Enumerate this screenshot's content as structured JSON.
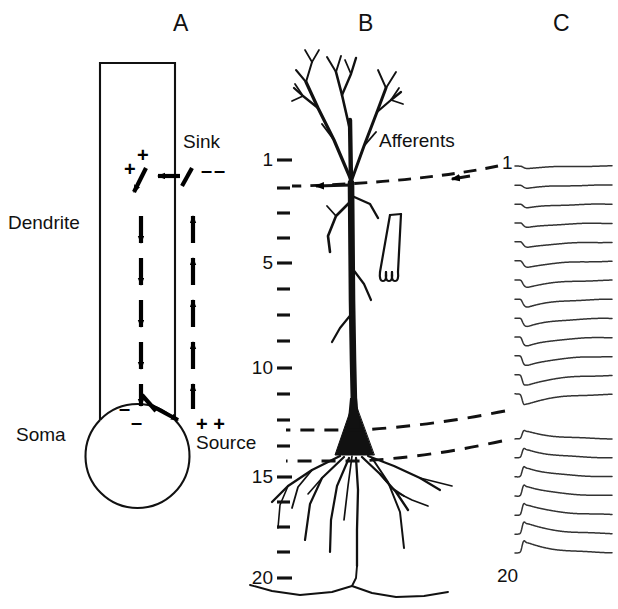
{
  "figure": {
    "background": "#ffffff",
    "ink": "#111111",
    "width": 618,
    "height": 609
  },
  "panels": [
    {
      "id": "A",
      "letter": "A",
      "x": 173,
      "y": 10
    },
    {
      "id": "B",
      "letter": "B",
      "x": 358,
      "y": 10
    },
    {
      "id": "C",
      "letter": "C",
      "x": 553,
      "y": 10
    }
  ],
  "panel_a": {
    "labels": {
      "dendrite": "Dendrite",
      "soma": "Soma",
      "sink": "Sink",
      "source": "Source"
    },
    "charges": {
      "sink_inside": "+",
      "sink_inside_2": "+",
      "sink_outside": "––",
      "source_inside": "–",
      "source_inside_2": "–",
      "source_outside": "+ +"
    },
    "geometry": {
      "dendrite_left": 100,
      "dendrite_right": 175,
      "dendrite_top": 63,
      "soma_cx": 137,
      "soma_cy": 455,
      "soma_r": 52
    },
    "arrow_counts": {
      "inside_downward": 5,
      "outside_upward": 5
    }
  },
  "panel_b": {
    "labels": {
      "afferents": "Afferents"
    },
    "depth_scale": {
      "unit_ticks": 20,
      "labeled": [
        {
          "value": "1",
          "y": 160
        },
        {
          "value": "5",
          "y": 263
        },
        {
          "value": "10",
          "y": 368
        },
        {
          "value": "15",
          "y": 477
        },
        {
          "value": "20",
          "y": 578
        }
      ],
      "minor_y": [
        188,
        213,
        238,
        289,
        315,
        341,
        394,
        420,
        446,
        502,
        527,
        552
      ],
      "tick_x_start": 277,
      "tick_x_end": 292
    },
    "dashed_lines": [
      {
        "name": "afferent-band",
        "y": 183,
        "arrowheads": 2
      },
      {
        "name": "soma-upper-band",
        "y": 428,
        "arrowheads": 0
      },
      {
        "name": "soma-lower-band",
        "y": 458,
        "arrowheads": 0
      }
    ],
    "electrode": {
      "name": "recording-pipette",
      "x": 400,
      "y": 218
    }
  },
  "chart_data": {
    "type": "line",
    "title": "C",
    "xlabel": "",
    "ylabel": "Depth (tick units)",
    "legend": "none",
    "grid": false,
    "depth_labels": {
      "first": "1",
      "last": "20"
    },
    "x_range_ms": [
      0,
      30
    ],
    "traces": [
      {
        "depth": 1,
        "polarity": "negative",
        "amplitude": 0.22,
        "spike": 0.0
      },
      {
        "depth": 2,
        "polarity": "negative",
        "amplitude": 0.3,
        "spike": 0.0
      },
      {
        "depth": 3,
        "polarity": "negative",
        "amplitude": 0.38,
        "spike": 0.0
      },
      {
        "depth": 4,
        "polarity": "negative",
        "amplitude": 0.46,
        "spike": 0.0
      },
      {
        "depth": 5,
        "polarity": "negative",
        "amplitude": 0.54,
        "spike": 0.0
      },
      {
        "depth": 6,
        "polarity": "negative",
        "amplitude": 0.62,
        "spike": 0.02
      },
      {
        "depth": 7,
        "polarity": "negative",
        "amplitude": 0.7,
        "spike": 0.05
      },
      {
        "depth": 8,
        "polarity": "negative",
        "amplitude": 0.78,
        "spike": 0.08
      },
      {
        "depth": 9,
        "polarity": "negative",
        "amplitude": 0.84,
        "spike": 0.12
      },
      {
        "depth": 10,
        "polarity": "negative",
        "amplitude": 0.9,
        "spike": 0.18
      },
      {
        "depth": 11,
        "polarity": "negative",
        "amplitude": 0.95,
        "spike": 0.26
      },
      {
        "depth": 12,
        "polarity": "negative",
        "amplitude": 1.0,
        "spike": 0.36
      },
      {
        "depth": 13,
        "polarity": "negative",
        "amplitude": 0.96,
        "spike": 0.46
      },
      {
        "depth": 14,
        "polarity": "positive",
        "amplitude": 0.72,
        "spike": 0.4
      },
      {
        "depth": 15,
        "polarity": "positive",
        "amplitude": 0.8,
        "spike": 0.48
      },
      {
        "depth": 16,
        "polarity": "positive",
        "amplitude": 0.88,
        "spike": 0.54
      },
      {
        "depth": 17,
        "polarity": "positive",
        "amplitude": 0.94,
        "spike": 0.58
      },
      {
        "depth": 18,
        "polarity": "positive",
        "amplitude": 0.98,
        "spike": 0.6
      },
      {
        "depth": 19,
        "polarity": "positive",
        "amplitude": 1.0,
        "spike": 0.62
      },
      {
        "depth": 20,
        "polarity": "positive",
        "amplitude": 0.98,
        "spike": 0.64
      }
    ],
    "layout": {
      "x0": 515,
      "x1": 612,
      "first_trace_y": 166,
      "row_spacing": 19.0,
      "group_gap_after": 13,
      "gap_px": 26
    }
  }
}
